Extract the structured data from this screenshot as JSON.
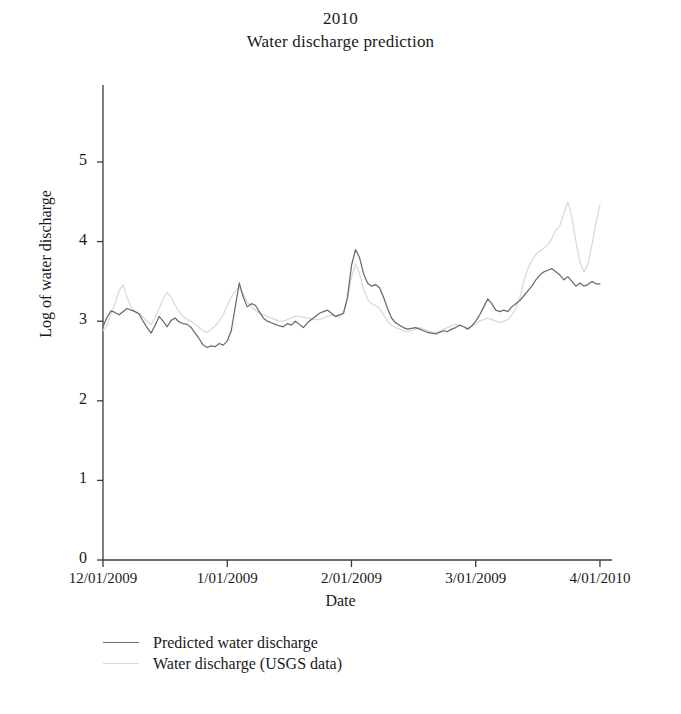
{
  "chart_data": {
    "type": "line",
    "title": "Water discharge prediction",
    "supertitle": "2010",
    "xlabel": "Date",
    "ylabel": "Log of water discharge",
    "grid": false,
    "legend_position": "below-left",
    "ylim": [
      0,
      5.6
    ],
    "yticks": [
      "0",
      "1",
      "2",
      "3",
      "4",
      "5"
    ],
    "ytick_values": [
      0,
      1,
      2,
      3,
      4,
      5
    ],
    "xticks": [
      "12/01/2009",
      "1/01/2009",
      "2/01/2009",
      "3/01/2009",
      "4/01/2010"
    ],
    "xtick_values": [
      0,
      31,
      62,
      93,
      124
    ],
    "xlim": [
      0,
      127
    ],
    "colors": {
      "predicted": "#6b6b6b",
      "usgs": "#d9d9d9",
      "axis": "#3b3b3b",
      "text": "#1a1a1a"
    },
    "series": [
      {
        "name": "Predicted water discharge",
        "color": "#6b6b6b",
        "x": [
          0,
          1,
          2,
          3,
          4,
          5,
          6,
          7,
          8,
          9,
          10,
          11,
          12,
          13,
          14,
          15,
          16,
          17,
          18,
          19,
          20,
          21,
          22,
          23,
          24,
          25,
          26,
          27,
          28,
          29,
          30,
          31,
          32,
          33,
          34,
          35,
          36,
          37,
          38,
          39,
          40,
          41,
          42,
          43,
          44,
          45,
          46,
          47,
          48,
          49,
          50,
          51,
          52,
          53,
          54,
          55,
          56,
          57,
          58,
          59,
          60,
          61,
          62,
          63,
          64,
          65,
          66,
          67,
          68,
          69,
          70,
          71,
          72,
          73,
          74,
          75,
          76,
          77,
          78,
          79,
          80,
          81,
          82,
          83,
          84,
          85,
          86,
          87,
          88,
          89,
          90,
          91,
          92,
          93,
          94,
          95,
          96,
          97,
          98,
          99,
          100,
          101,
          102,
          103,
          104,
          105,
          106,
          107,
          108,
          109,
          110,
          111,
          112,
          113,
          114,
          115,
          116,
          117,
          118,
          119,
          120,
          121,
          122,
          123,
          124
        ],
        "values": [
          2.93,
          3.05,
          3.13,
          3.11,
          3.08,
          3.12,
          3.16,
          3.14,
          3.12,
          3.09,
          3.0,
          2.92,
          2.85,
          2.95,
          3.06,
          3.0,
          2.93,
          3.01,
          3.04,
          2.99,
          2.97,
          2.96,
          2.92,
          2.85,
          2.78,
          2.7,
          2.67,
          2.69,
          2.68,
          2.72,
          2.7,
          2.75,
          2.88,
          3.18,
          3.48,
          3.3,
          3.18,
          3.22,
          3.2,
          3.12,
          3.04,
          3.0,
          2.98,
          2.96,
          2.94,
          2.93,
          2.97,
          2.95,
          3.0,
          2.96,
          2.92,
          2.98,
          3.02,
          3.06,
          3.1,
          3.12,
          3.14,
          3.1,
          3.06,
          3.08,
          3.1,
          3.3,
          3.7,
          3.9,
          3.8,
          3.6,
          3.48,
          3.44,
          3.46,
          3.42,
          3.3,
          3.16,
          3.04,
          2.98,
          2.95,
          2.92,
          2.9,
          2.91,
          2.92,
          2.9,
          2.88,
          2.86,
          2.85,
          2.84,
          2.86,
          2.88,
          2.87,
          2.9,
          2.92,
          2.95,
          2.93,
          2.9,
          2.94,
          3.0,
          3.08,
          3.18,
          3.28,
          3.22,
          3.14,
          3.12,
          3.14,
          3.12,
          3.18,
          3.22,
          3.26,
          3.32,
          3.38,
          3.44,
          3.52,
          3.58,
          3.62,
          3.64,
          3.66,
          3.62,
          3.58,
          3.52,
          3.56,
          3.5,
          3.44,
          3.48,
          3.44,
          3.46,
          3.5,
          3.47,
          3.47
        ]
      },
      {
        "name": "Water discharge (USGS data)",
        "color": "#d9d9d9",
        "x": [
          0,
          1,
          2,
          3,
          4,
          5,
          6,
          7,
          8,
          9,
          10,
          11,
          12,
          13,
          14,
          15,
          16,
          17,
          18,
          19,
          20,
          21,
          22,
          23,
          24,
          25,
          26,
          27,
          28,
          29,
          30,
          31,
          32,
          33,
          34,
          35,
          36,
          37,
          38,
          39,
          40,
          41,
          42,
          43,
          44,
          45,
          46,
          47,
          48,
          49,
          50,
          51,
          52,
          53,
          54,
          55,
          56,
          57,
          58,
          59,
          60,
          61,
          62,
          63,
          64,
          65,
          66,
          67,
          68,
          69,
          70,
          71,
          72,
          73,
          74,
          75,
          76,
          77,
          78,
          79,
          80,
          81,
          82,
          83,
          84,
          85,
          86,
          87,
          88,
          89,
          90,
          91,
          92,
          93,
          94,
          95,
          96,
          97,
          98,
          99,
          100,
          101,
          102,
          103,
          104,
          105,
          106,
          107,
          108,
          109,
          110,
          111,
          112,
          113,
          114,
          115,
          116,
          117,
          118,
          119,
          120,
          121,
          122,
          123,
          124
        ],
        "values": [
          2.88,
          2.95,
          3.1,
          3.22,
          3.38,
          3.46,
          3.3,
          3.18,
          3.12,
          3.1,
          3.05,
          3.0,
          2.96,
          3.04,
          3.16,
          3.28,
          3.36,
          3.3,
          3.2,
          3.12,
          3.06,
          3.02,
          3.0,
          2.96,
          2.92,
          2.88,
          2.86,
          2.9,
          2.94,
          3.0,
          3.08,
          3.2,
          3.3,
          3.38,
          3.42,
          3.34,
          3.24,
          3.18,
          3.14,
          3.1,
          3.08,
          3.06,
          3.04,
          3.02,
          3.0,
          3.0,
          3.02,
          3.04,
          3.06,
          3.06,
          3.05,
          3.04,
          3.03,
          3.02,
          3.02,
          3.04,
          3.06,
          3.08,
          3.06,
          3.05,
          3.1,
          3.28,
          3.55,
          3.72,
          3.6,
          3.4,
          3.28,
          3.22,
          3.2,
          3.16,
          3.08,
          3.0,
          2.95,
          2.92,
          2.9,
          2.88,
          2.87,
          2.88,
          2.9,
          2.92,
          2.9,
          2.88,
          2.86,
          2.86,
          2.88,
          2.9,
          2.92,
          2.94,
          2.96,
          2.95,
          2.93,
          2.92,
          2.94,
          2.96,
          3.0,
          3.02,
          3.04,
          3.02,
          3.0,
          2.98,
          3.0,
          3.02,
          3.08,
          3.16,
          3.3,
          3.5,
          3.66,
          3.76,
          3.84,
          3.88,
          3.92,
          3.96,
          4.04,
          4.14,
          4.2,
          4.36,
          4.5,
          4.3,
          4.0,
          3.74,
          3.62,
          3.72,
          3.96,
          4.24,
          4.46
        ]
      }
    ]
  },
  "legend": {
    "items": [
      {
        "label": "Predicted water discharge",
        "color": "#6b6b6b"
      },
      {
        "label": "Water discharge (USGS data)",
        "color": "#d9d9d9"
      }
    ]
  }
}
